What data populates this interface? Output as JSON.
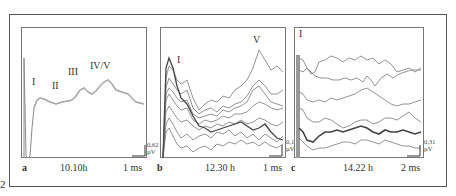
{
  "figure": {
    "number": "2",
    "panels": [
      {
        "id": "a",
        "time": "10.10h",
        "time_scale": "1 ms",
        "amp_scale": [
          "0,62",
          "µV"
        ],
        "wave_labels": [
          "I",
          "II",
          "III",
          "IV/V"
        ]
      },
      {
        "id": "b",
        "time": "12.30 h",
        "time_scale": "1 ms",
        "amp_scale": [
          "0,15",
          "µV"
        ],
        "wave_labels": [
          "I",
          "V"
        ]
      },
      {
        "id": "c",
        "time": "14.22 h",
        "time_scale": "2 ms",
        "amp_scale": [
          "0,31",
          "µV"
        ],
        "wave_labels": [
          "I"
        ]
      }
    ]
  }
}
